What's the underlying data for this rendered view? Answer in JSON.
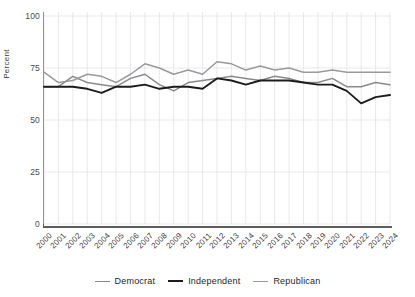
{
  "chart_data": {
    "type": "line",
    "title": "",
    "subtitle": "",
    "xlabel": "",
    "ylabel": "Percent",
    "ylim": [
      0,
      100
    ],
    "yticks": [
      0,
      25,
      50,
      75,
      100
    ],
    "xlim": [
      2000,
      2024
    ],
    "grid": true,
    "legend_position": "bottom",
    "x": [
      2000,
      2001,
      2002,
      2003,
      2004,
      2005,
      2006,
      2007,
      2008,
      2009,
      2010,
      2011,
      2012,
      2013,
      2014,
      2015,
      2016,
      2017,
      2018,
      2019,
      2020,
      2021,
      2022,
      2023,
      2024
    ],
    "categories": [
      "2000",
      "2001",
      "2002",
      "2003",
      "2004",
      "2005",
      "2006",
      "2007",
      "2008",
      "2009",
      "2010",
      "2011",
      "2012",
      "2013",
      "2014",
      "2015",
      "2016",
      "2017",
      "2018",
      "2019",
      "2020",
      "2021",
      "2022",
      "2023",
      "2024"
    ],
    "series": [
      {
        "name": "Democrat",
        "color": "#8a8a8a",
        "width": 1.5,
        "values": [
          66,
          66,
          71,
          68,
          67,
          66,
          70,
          72,
          67,
          64,
          68,
          69,
          70,
          71,
          70,
          69,
          71,
          70,
          68,
          68,
          70,
          66,
          66,
          68,
          67
        ]
      },
      {
        "name": "Independent",
        "color": "#1c1c1c",
        "width": 1.9,
        "values": [
          66,
          66,
          66,
          65,
          63,
          66,
          66,
          67,
          65,
          66,
          66,
          65,
          70,
          69,
          67,
          69,
          69,
          69,
          68,
          67,
          67,
          64,
          58,
          61,
          62
        ]
      },
      {
        "name": "Republican",
        "color": "#9a9a9a",
        "width": 1.5,
        "values": [
          73,
          68,
          69,
          72,
          71,
          68,
          72,
          77,
          75,
          72,
          74,
          72,
          78,
          77,
          74,
          76,
          74,
          75,
          73,
          73,
          74,
          73,
          73,
          73,
          73
        ]
      }
    ]
  },
  "axis": {
    "y_title": "Percent",
    "y_ticks": [
      "0",
      "25",
      "50",
      "75",
      "100"
    ],
    "x_ticks": [
      "2000",
      "2001",
      "2002",
      "2003",
      "2004",
      "2005",
      "2006",
      "2007",
      "2008",
      "2009",
      "2010",
      "2011",
      "2012",
      "2013",
      "2014",
      "2015",
      "2016",
      "2017",
      "2018",
      "2019",
      "2020",
      "2021",
      "2022",
      "2023",
      "2024"
    ]
  },
  "legend": {
    "items": [
      {
        "label": "Democrat",
        "color": "#8a8a8a",
        "thickness": "1.6px"
      },
      {
        "label": "Independent",
        "color": "#1c1c1c",
        "thickness": "2.2px"
      },
      {
        "label": "Republican",
        "color": "#9a9a9a",
        "thickness": "1.6px"
      }
    ]
  },
  "colors": {
    "background": "#ffffff",
    "axis": "#5d5d5d",
    "grid": "#e3e3e8",
    "text": "#2b2b2b"
  }
}
